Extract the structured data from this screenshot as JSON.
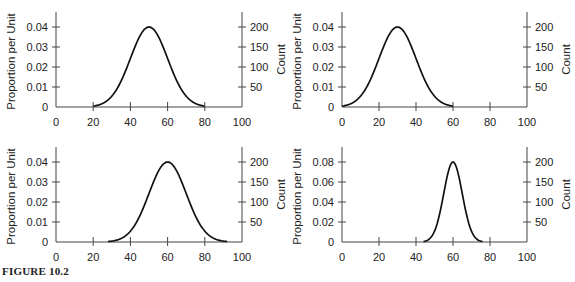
{
  "figure": {
    "caption": "FIGURE 10.2"
  },
  "chart_data": [
    {
      "type": "line",
      "title": "",
      "xlabel": "",
      "ylabel": "Proportion per Unit",
      "y2label": "Count",
      "xlim": [
        0,
        100
      ],
      "xticks": [
        0,
        20,
        40,
        60,
        80,
        100
      ],
      "ylim": [
        0,
        0.046
      ],
      "yticks": [
        0,
        0.01,
        0.02,
        0.03,
        0.04
      ],
      "yticklabels": [
        "0",
        "0.01",
        "0.02",
        "0.03",
        "0.04"
      ],
      "y2ticks": [
        50,
        100,
        150,
        200
      ],
      "series": [
        {
          "name": "normal curve",
          "mean": 50,
          "sd": 10,
          "peak": 0.04,
          "x_range": [
            20,
            80
          ]
        }
      ],
      "grid": false
    },
    {
      "type": "line",
      "title": "",
      "xlabel": "",
      "ylabel": "Proportion per Unit",
      "y2label": "Count",
      "xlim": [
        0,
        100
      ],
      "xticks": [
        0,
        20,
        40,
        60,
        80,
        100
      ],
      "ylim": [
        0,
        0.046
      ],
      "yticks": [
        0,
        0.01,
        0.02,
        0.03,
        0.04
      ],
      "yticklabels": [
        "0",
        "0.01",
        "0.02",
        "0.03",
        "0.04"
      ],
      "y2ticks": [
        50,
        100,
        150,
        200
      ],
      "series": [
        {
          "name": "normal curve",
          "mean": 30,
          "sd": 10,
          "peak": 0.04,
          "x_range": [
            0,
            60
          ]
        }
      ],
      "grid": false
    },
    {
      "type": "line",
      "title": "",
      "xlabel": "",
      "ylabel": "Proportion per Unit",
      "y2label": "Count",
      "xlim": [
        0,
        100
      ],
      "xticks": [
        0,
        20,
        40,
        60,
        80,
        100
      ],
      "ylim": [
        0,
        0.046
      ],
      "yticks": [
        0,
        0.01,
        0.02,
        0.03,
        0.04
      ],
      "yticklabels": [
        "0",
        "0.01",
        "0.02",
        "0.03",
        "0.04"
      ],
      "y2ticks": [
        50,
        100,
        150,
        200
      ],
      "series": [
        {
          "name": "normal curve",
          "mean": 60,
          "sd": 10,
          "peak": 0.04,
          "x_range": [
            28,
            92
          ]
        }
      ],
      "grid": false
    },
    {
      "type": "line",
      "title": "",
      "xlabel": "",
      "ylabel": "Proportion per Unit",
      "y2label": "Count",
      "xlim": [
        0,
        100
      ],
      "xticks": [
        0,
        20,
        40,
        60,
        80,
        100
      ],
      "ylim": [
        0,
        0.092
      ],
      "yticks": [
        0,
        0.02,
        0.04,
        0.06,
        0.08
      ],
      "yticklabels": [
        "0",
        "0.02",
        "0.04",
        "0.06",
        "0.08"
      ],
      "y2ticks": [
        50,
        100,
        150,
        200
      ],
      "series": [
        {
          "name": "normal curve",
          "mean": 60,
          "sd": 5,
          "peak": 0.08,
          "x_range": [
            44,
            76
          ]
        }
      ],
      "grid": false
    }
  ]
}
